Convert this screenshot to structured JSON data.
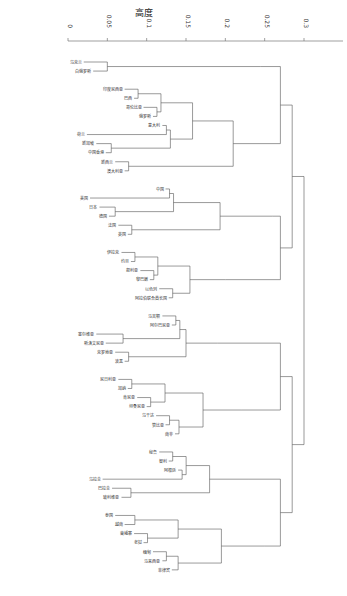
{
  "chart_data": {
    "type": "dendrogram",
    "title": "高度",
    "xlabel": "高度",
    "ylabel": "",
    "axis_position": "top",
    "ticks": [
      "0",
      "0.05",
      "0.1",
      "0.15",
      "0.2",
      "0.25",
      "0.3"
    ],
    "tick_values": [
      0,
      0.05,
      0.1,
      0.15,
      0.2,
      0.25,
      0.3
    ],
    "xlim": [
      0,
      0.32
    ],
    "grid": false,
    "legend": null,
    "leaf_count_approx": 150,
    "clusters": [
      {
        "name": "cluster-1",
        "leaves": [
          "乌克兰",
          "白俄罗斯"
        ],
        "merge_height": 0.245
      },
      {
        "name": "cluster-2",
        "leaves": [
          "印度尼西亚",
          "巴西",
          "哥伦比亚",
          "俄罗斯",
          "意大利",
          "荷兰",
          "新加坡",
          "中国香港",
          "新西兰",
          "澳大利亚"
        ],
        "merge_height": 0.21
      },
      {
        "name": "cluster-3",
        "leaves": [
          "中国",
          "美国",
          "日本",
          "德国",
          "法国",
          "英国"
        ],
        "merge_height": 0.26
      },
      {
        "name": "cluster-4",
        "leaves": [
          "伊拉克",
          "约旦",
          "叙利亚",
          "黎巴嫩",
          "以色列",
          "阿拉伯联合酋长国"
        ],
        "merge_height": 0.2
      },
      {
        "name": "cluster-5",
        "leaves": [
          "马其顿",
          "阿尔巴尼亚",
          "塞尔维亚",
          "斯洛文尼亚",
          "克罗地亚",
          "波黑"
        ],
        "merge_height": 0.19
      },
      {
        "name": "cluster-6",
        "leaves": [
          "尼日利亚",
          "加纳",
          "肯尼亚",
          "坦桑尼亚",
          "乌干达",
          "赞比亚",
          "南非"
        ],
        "merge_height": 0.22
      },
      {
        "name": "cluster-7",
        "leaves": [
          "秘鲁",
          "智利",
          "阿根廷",
          "乌拉圭",
          "巴拉圭",
          "玻利维亚"
        ],
        "merge_height": 0.23
      },
      {
        "name": "cluster-8",
        "leaves": [
          "泰国",
          "越南",
          "柬埔寨",
          "老挝",
          "缅甸",
          "马来西亚",
          "菲律宾"
        ],
        "merge_height": 0.25
      }
    ],
    "root_height": 0.305
  }
}
